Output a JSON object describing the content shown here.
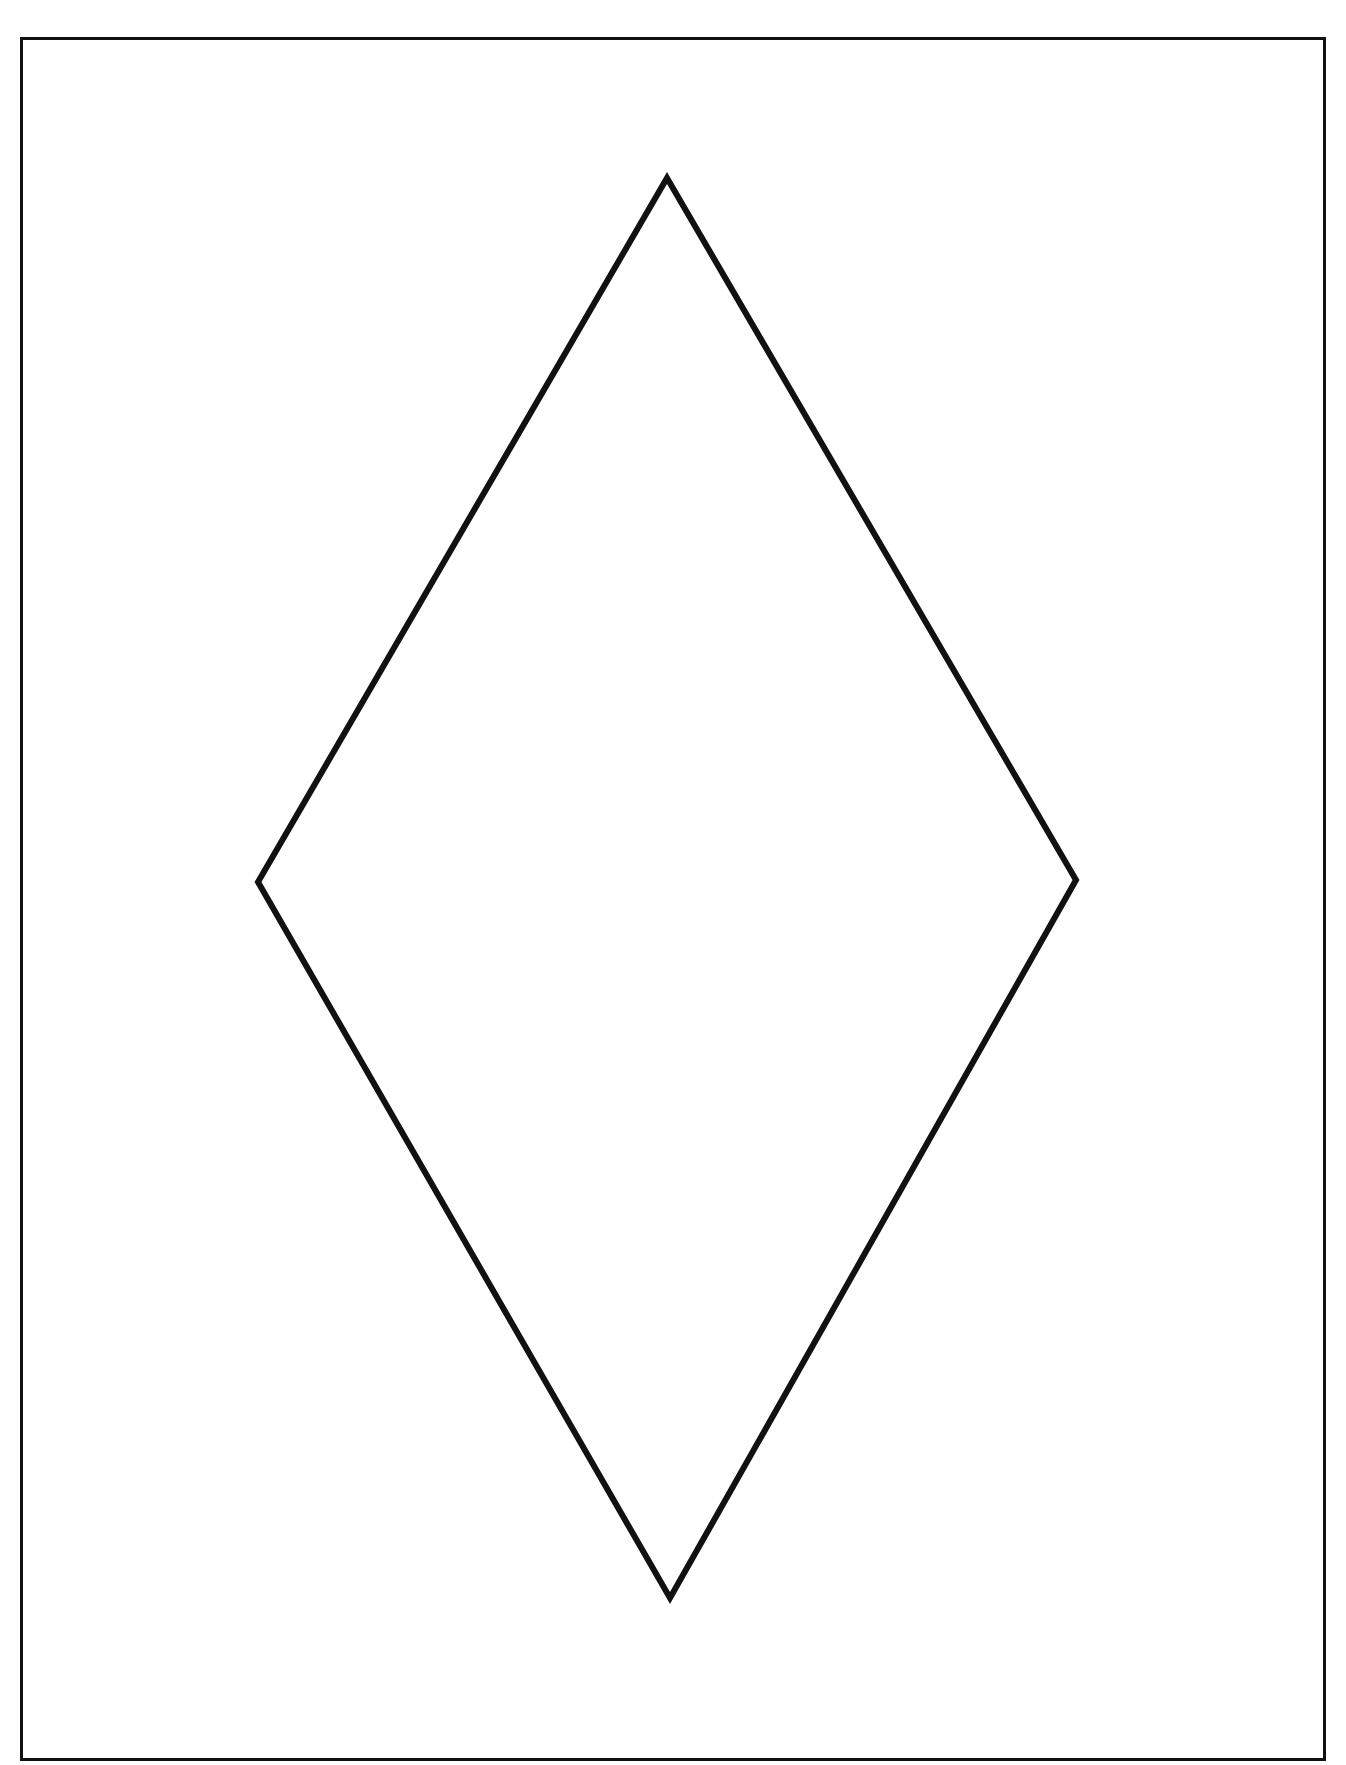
{
  "diagram": {
    "background_color": "#ffffff",
    "stroke_color": "#111111",
    "frame": {
      "x": 20,
      "y": 37,
      "width": 1306,
      "height": 1724,
      "stroke_width": 3
    },
    "diamond": {
      "stroke_width": 6,
      "vertices": {
        "top": [
          667,
          178
        ],
        "right": [
          1076,
          880
        ],
        "bottom": [
          670,
          1598
        ],
        "left": [
          258,
          882
        ]
      }
    },
    "labels": []
  }
}
